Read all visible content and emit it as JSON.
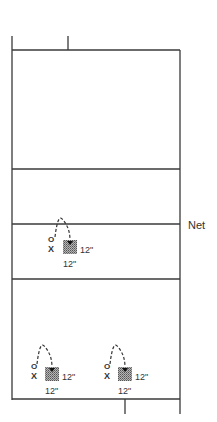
{
  "diagram": {
    "net_label": "Net",
    "colors": {
      "line": "#3a3a3a",
      "square": "#8c8c8c",
      "text": "#333333"
    },
    "drills": [
      {
        "id": "drill-top",
        "x_mark": "X",
        "o_mark": "O",
        "side_label": "12\"",
        "bottom_label": "12\""
      },
      {
        "id": "drill-bottom-left",
        "x_mark": "X",
        "o_mark": "O",
        "side_label": "12\"",
        "bottom_label": "12\""
      },
      {
        "id": "drill-bottom-right",
        "x_mark": "X",
        "o_mark": "O",
        "side_label": "12\"",
        "bottom_label": "12\""
      }
    ]
  }
}
